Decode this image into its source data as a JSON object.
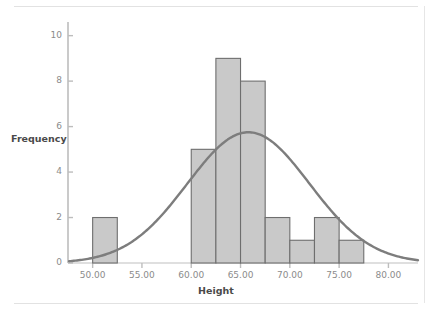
{
  "chart_data": {
    "type": "bar",
    "title": "",
    "subtitle": "",
    "xlabel": "Height",
    "ylabel": "Frequency",
    "xlim": [
      47.5,
      83.0
    ],
    "ylim": [
      0,
      10.6
    ],
    "grid": false,
    "legend": null,
    "bin_width": 2.5,
    "categories": [
      "50.0-52.5",
      "60.0-62.5",
      "62.5-65.0",
      "65.0-67.5",
      "67.5-70.0",
      "70.0-72.5",
      "72.5-75.0",
      "75.0-77.5"
    ],
    "values": [
      2,
      5,
      9,
      8,
      2,
      1,
      2,
      1
    ],
    "bins": [
      {
        "start": 50.0,
        "end": 52.5,
        "frequency": 2
      },
      {
        "start": 60.0,
        "end": 62.5,
        "frequency": 5
      },
      {
        "start": 62.5,
        "end": 65.0,
        "frequency": 9
      },
      {
        "start": 65.0,
        "end": 67.5,
        "frequency": 8
      },
      {
        "start": 67.5,
        "end": 70.0,
        "frequency": 2
      },
      {
        "start": 70.0,
        "end": 72.5,
        "frequency": 1
      },
      {
        "start": 72.5,
        "end": 75.0,
        "frequency": 2
      },
      {
        "start": 75.0,
        "end": 77.5,
        "frequency": 1
      }
    ],
    "xticks": [
      "50.00",
      "55.00",
      "60.00",
      "65.00",
      "70.00",
      "75.00",
      "80.00"
    ],
    "xtick_values": [
      50,
      55,
      60,
      65,
      70,
      75,
      80
    ],
    "yticks": [
      "0",
      "2",
      "4",
      "6",
      "8",
      "10"
    ],
    "ytick_values": [
      0,
      2,
      4,
      6,
      8,
      10
    ],
    "overlay_curve": {
      "name": "normal-distribution-curve",
      "mean": 65.8,
      "std_dev": 6.2,
      "peak_value": 5.75,
      "x_start": 47.6,
      "x_end": 83.0
    },
    "colors": {
      "bar_fill": "#c9c9c9",
      "bar_border": "#6e6e6e",
      "curve": "#7d7d7d",
      "axis": "#bdbdbd",
      "tick_text": "#8b8b8b",
      "title_text": "#4a4a4a",
      "background": "#ffffff",
      "frame_rule": "#e2e2e2"
    }
  }
}
